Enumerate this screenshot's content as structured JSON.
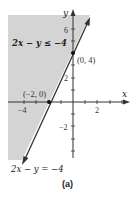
{
  "figure": {
    "caption": "(a)",
    "inequality_label": "2x − y ≤ −4",
    "boundary_label": "2x − y = −4",
    "shade_color": "#d4d4d4",
    "line_color": "#333333",
    "axes": {
      "x_label": "x",
      "y_label": "y",
      "x_ticks": [
        {
          "value": -4,
          "label": "−4"
        },
        {
          "value": 2,
          "label": "2"
        }
      ],
      "y_ticks": [
        {
          "value": 6,
          "label": "6"
        },
        {
          "value": 2,
          "label": "2"
        },
        {
          "value": -2,
          "label": "−2"
        }
      ]
    },
    "points": [
      {
        "label": "(0, 4)",
        "x": 0,
        "y": 4
      },
      {
        "label": "(−2, 0)",
        "x": -2,
        "y": 0
      }
    ]
  }
}
